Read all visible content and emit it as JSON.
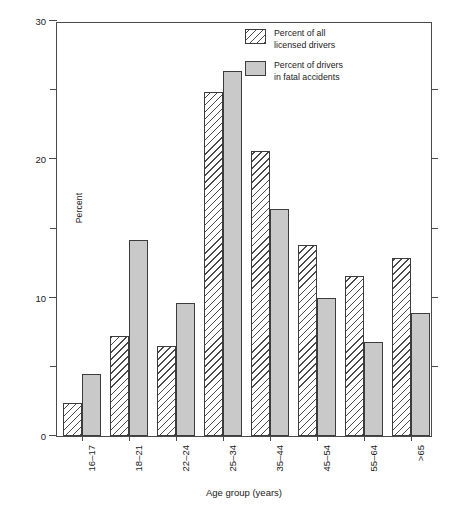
{
  "chart_data": {
    "type": "bar",
    "title": "",
    "xlabel": "Age group (years)",
    "ylabel": "Percent",
    "categories": [
      "16–17",
      "18–21",
      "22–24",
      "25–34",
      "35–44",
      "45–54",
      "55–64",
      ">65"
    ],
    "series": [
      {
        "name": "Percent of all licensed drivers",
        "style": "hatched",
        "values": [
          2.4,
          7.2,
          6.5,
          24.9,
          20.6,
          13.8,
          11.6,
          12.9
        ]
      },
      {
        "name": "Percent of drivers in fatal accidents",
        "style": "solid-gray",
        "values": [
          4.5,
          14.2,
          9.6,
          26.4,
          16.4,
          10.0,
          6.8,
          8.9
        ]
      }
    ],
    "ylim": [
      0,
      30
    ],
    "yticks_major": [
      0,
      10,
      20,
      30
    ],
    "yticks_minor": [
      5,
      15,
      25
    ],
    "ytick_labels": [
      "0",
      "10",
      "20",
      "30"
    ],
    "grid": false,
    "legend_position": "top-right"
  },
  "legend": {
    "entries": [
      {
        "line1": "Percent of all",
        "line2": "licensed drivers"
      },
      {
        "line1": "Percent of drivers",
        "line2": "in fatal accidents"
      }
    ]
  },
  "axes": {
    "y_title": "Percent",
    "x_title": "Age group (years)"
  },
  "colors": {
    "bar_solid_fill": "#c9c9c9",
    "bar_outline": "#3c3c3c",
    "axis": "#4a4a4a",
    "text": "#1a1a1a",
    "background": "#ffffff"
  },
  "caption": {
    "text": ""
  }
}
